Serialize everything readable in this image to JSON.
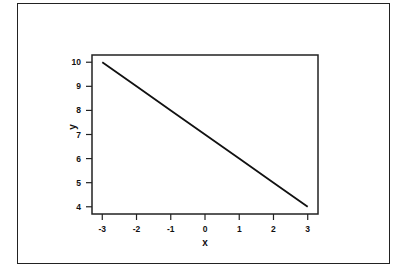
{
  "chart_data": {
    "type": "line",
    "title": "",
    "xlabel": "x",
    "ylabel": "y",
    "xlim": [
      -3.3,
      3.3
    ],
    "ylim": [
      3.7,
      10.3
    ],
    "x_ticks": [
      -3,
      -2,
      -1,
      0,
      1,
      2,
      3
    ],
    "x_tick_labels": [
      "-3",
      "-2",
      "-1",
      "0",
      "1",
      "2",
      "3"
    ],
    "y_ticks": [
      4,
      5,
      6,
      7,
      8,
      9,
      10
    ],
    "y_tick_labels": [
      "4",
      "5",
      "6",
      "7",
      "8",
      "9",
      "10"
    ],
    "grid": false,
    "legend": null,
    "series": [
      {
        "name": "y",
        "x": [
          -3,
          -2,
          -1,
          0,
          1,
          2,
          3
        ],
        "values": [
          10,
          9,
          8,
          7,
          6,
          5,
          4
        ]
      }
    ]
  },
  "labels": {
    "x_axis": "x",
    "y_axis": "y"
  },
  "colors": {
    "line": "#111111",
    "axis": "#222222",
    "background": "#ffffff"
  }
}
